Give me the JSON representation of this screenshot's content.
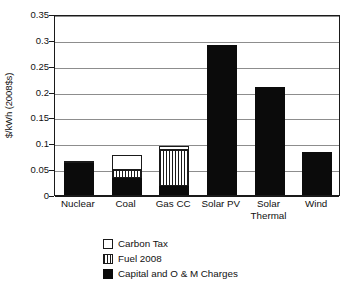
{
  "chart_data": {
    "type": "bar",
    "subtype": "stacked",
    "title": "",
    "xlabel": "",
    "ylabel": "$/kWh (2008$s)",
    "ylim": [
      0,
      0.35
    ],
    "yticks": [
      "0",
      "0.05",
      "0.1",
      "0.15",
      "0.2",
      "0.25",
      "0.3",
      "0.35"
    ],
    "ytick_values": [
      0,
      0.05,
      0.1,
      0.15,
      0.2,
      0.25,
      0.3,
      0.35
    ],
    "grid": true,
    "legend_position": "bottom",
    "categories": [
      "Nuclear",
      "Coal",
      "Gas CC",
      "Solar PV",
      "Solar Thermal",
      "Wind"
    ],
    "category_lines": [
      [
        "Nuclear"
      ],
      [
        "Coal"
      ],
      [
        "Gas CC"
      ],
      [
        "Solar PV"
      ],
      [
        "Solar",
        "Thermal"
      ],
      [
        "Wind"
      ]
    ],
    "series": [
      {
        "name": "Capital and O & M Charges",
        "pattern": "solid-black",
        "color": "#0b0b0b",
        "values": [
          0.061,
          0.033,
          0.018,
          0.29,
          0.208,
          0.083
        ]
      },
      {
        "name": "Fuel 2008",
        "pattern": "vertical-stripes",
        "color": "#1a1a1a",
        "values": [
          0.004,
          0.015,
          0.069,
          0,
          0,
          0
        ]
      },
      {
        "name": "Carbon Tax",
        "pattern": "white-outline",
        "color": "#ffffff",
        "values": [
          0,
          0.03,
          0.008,
          0,
          0,
          0
        ]
      }
    ],
    "totals": [
      0.065,
      0.078,
      0.095,
      0.29,
      0.208,
      0.083
    ]
  },
  "legend": {
    "items": [
      {
        "label": "Carbon Tax",
        "swatch": "carbon-tax-swatch"
      },
      {
        "label": "Fuel 2008",
        "swatch": "fuel-2008-swatch"
      },
      {
        "label": "Capital and O & M Charges",
        "swatch": "capital-om-swatch"
      }
    ]
  },
  "colors": {
    "axis": "#1a1a1a",
    "gridline": "#8d8d8d",
    "background": "#ffffff",
    "bar_black": "#0b0b0b"
  }
}
